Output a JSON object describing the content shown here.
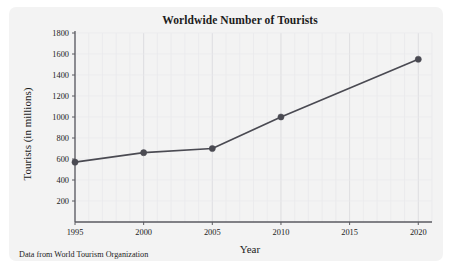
{
  "figure": {
    "footnote": "Data from World Tourism Organization",
    "panel_color": "#f3f3f3",
    "background_color": "#ffffff"
  },
  "chart_data": {
    "type": "line",
    "title": "Worldwide Number of Tourists",
    "xlabel": "Year",
    "ylabel": "Tourists (in millions)",
    "x": [
      1995,
      2000,
      2005,
      2010,
      2020
    ],
    "values": [
      570,
      660,
      700,
      1000,
      1550
    ],
    "series": [
      {
        "name": "Worldwide tourists",
        "x": [
          1995,
          2000,
          2005,
          2010,
          2020
        ],
        "values": [
          570,
          660,
          700,
          1000,
          1550
        ]
      }
    ],
    "xlim": [
      1995,
      2021
    ],
    "ylim": [
      0,
      1800
    ],
    "xticks": [
      1995,
      2000,
      2005,
      2010,
      2015,
      2020
    ],
    "xticklabels": [
      "1995",
      "2000",
      "2005",
      "2010",
      "2015",
      "2020"
    ],
    "yticks": [
      200,
      400,
      600,
      800,
      1000,
      1200,
      1400,
      1600,
      1800
    ],
    "yticklabels": [
      "200",
      "400",
      "600",
      "800",
      "1000",
      "1200",
      "1400",
      "1600",
      "1800"
    ],
    "grid": true,
    "grid_x_step": 1,
    "legend": null,
    "line_color": "#4a4a52",
    "marker_color": "#4a4a52",
    "marker": "circle"
  }
}
